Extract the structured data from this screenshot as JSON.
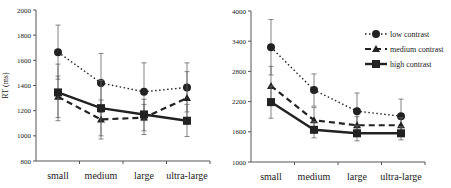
{
  "chart_data": [
    {
      "type": "line",
      "title": "",
      "xlabel": "",
      "ylabel": "RT (ms)",
      "ylim": [
        800,
        2000
      ],
      "yticks": [
        800,
        1000,
        1200,
        1400,
        1600,
        1800,
        2000
      ],
      "categories": [
        "small",
        "medium",
        "large",
        "ultra-large"
      ],
      "grid": false,
      "series": [
        {
          "name": "low contrast",
          "style": "dotted",
          "marker": "circle",
          "values": [
            1665,
            1420,
            1350,
            1385
          ],
          "error_upper": [
            1880,
            1655,
            1580,
            1580
          ],
          "error_lower": [
            1450,
            1185,
            1120,
            1190
          ]
        },
        {
          "name": "medium contrast",
          "style": "dashed",
          "marker": "triangle",
          "values": [
            1310,
            1130,
            1145,
            1300
          ],
          "error_upper": [
            1475,
            1285,
            1250,
            1510
          ],
          "error_lower": [
            1145,
            975,
            1040,
            1090
          ]
        },
        {
          "name": "high contrast",
          "style": "solid",
          "marker": "square",
          "values": [
            1345,
            1220,
            1170,
            1120
          ],
          "error_upper": [
            1570,
            1440,
            1290,
            1250
          ],
          "error_lower": [
            1120,
            1000,
            1010,
            995
          ]
        }
      ]
    },
    {
      "type": "line",
      "title": "",
      "xlabel": "",
      "ylabel": "",
      "ylim": [
        1000,
        4000
      ],
      "yticks": [
        1000,
        1600,
        2200,
        2800,
        3400,
        4000
      ],
      "categories": [
        "small",
        "medium",
        "large",
        "ultra-large"
      ],
      "grid": false,
      "legend_position": "upper right",
      "series": [
        {
          "name": "low contrast",
          "style": "dotted",
          "marker": "circle",
          "values": [
            3280,
            2430,
            2010,
            1910
          ],
          "error_upper": [
            3830,
            2750,
            2370,
            2250
          ],
          "error_lower": [
            2730,
            2110,
            1650,
            1570
          ]
        },
        {
          "name": "medium contrast",
          "style": "dashed",
          "marker": "triangle",
          "values": [
            2510,
            1830,
            1730,
            1730
          ],
          "error_upper": [
            2900,
            2080,
            1900,
            1880
          ],
          "error_lower": [
            2120,
            1580,
            1560,
            1580
          ]
        },
        {
          "name": "high contrast",
          "style": "solid",
          "marker": "square",
          "values": [
            2190,
            1640,
            1570,
            1570
          ],
          "error_upper": [
            2510,
            1800,
            1720,
            1700
          ],
          "error_lower": [
            1870,
            1480,
            1420,
            1440
          ]
        }
      ]
    }
  ],
  "legend": {
    "items": [
      "low contrast",
      "medium contrast",
      "high contrast"
    ]
  }
}
